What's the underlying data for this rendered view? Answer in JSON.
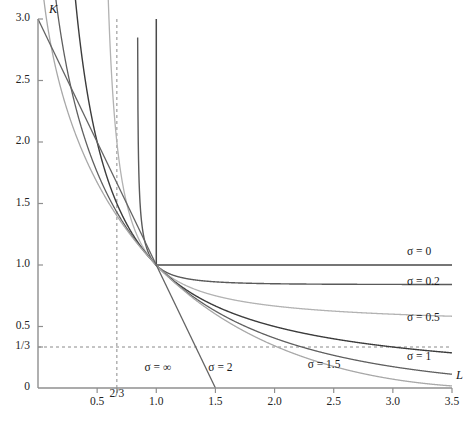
{
  "chart_data": {
    "type": "line",
    "title": "",
    "subtitle": "",
    "xlabel": "L",
    "ylabel": "K",
    "xlim": [
      0,
      3.5
    ],
    "ylim": [
      0,
      3.0
    ],
    "grid": false,
    "legend_position": "inline-annotations",
    "xticks": [
      {
        "value": 0.5,
        "label": "0.5"
      },
      {
        "value": 0.6667,
        "label": "2/3"
      },
      {
        "value": 1.0,
        "label": "1.0"
      },
      {
        "value": 1.5,
        "label": "1.5"
      },
      {
        "value": 2.0,
        "label": "2.0"
      },
      {
        "value": 2.5,
        "label": "2.5"
      },
      {
        "value": 3.0,
        "label": "3.0"
      },
      {
        "value": 3.5,
        "label": "3.5"
      }
    ],
    "yticks": [
      {
        "value": 0.0,
        "label": "0"
      },
      {
        "value": 0.3333,
        "label": "1/3"
      },
      {
        "value": 0.5,
        "label": "0.5"
      },
      {
        "value": 1.0,
        "label": "1.0"
      },
      {
        "value": 1.5,
        "label": "1.5"
      },
      {
        "value": 2.0,
        "label": "2.0"
      },
      {
        "value": 2.5,
        "label": "2.5"
      },
      {
        "value": 3.0,
        "label": "3.0"
      }
    ],
    "reference_lines": [
      {
        "name": "vertical-two-thirds",
        "orientation": "vertical",
        "value": 0.6667,
        "style": "dashed",
        "color": "#8a8a8a"
      },
      {
        "name": "horizontal-one-third",
        "orientation": "horizontal",
        "value": 0.3333,
        "style": "dashed",
        "color": "#8a8a8a"
      }
    ],
    "series": [
      {
        "name": "sigma-0",
        "label": "σ = 0",
        "sigma": 0,
        "color": "#4a4a4a",
        "width": 1.5,
        "kink": [
          1.0,
          1.0
        ],
        "label_at": [
          3.12,
          1.1
        ]
      },
      {
        "name": "sigma-0p2",
        "label": "σ = 0.2",
        "sigma": 0.2,
        "color": "#5a5a5a",
        "width": 1.4,
        "label_at": [
          3.12,
          0.855
        ]
      },
      {
        "name": "sigma-0p5",
        "label": "σ = 0.5",
        "sigma": 0.5,
        "color": "#b2b2b2",
        "width": 1.3,
        "label_at": [
          3.12,
          0.565
        ]
      },
      {
        "name": "sigma-1",
        "label": "σ = 1",
        "sigma": 1,
        "color": "#3c3c3c",
        "width": 1.4,
        "label_at": [
          3.12,
          0.245
        ]
      },
      {
        "name": "sigma-1p5",
        "label": "σ = 1.5",
        "sigma": 1.5,
        "color": "#5f5f5f",
        "width": 1.3,
        "label_at": [
          2.28,
          0.175
        ]
      },
      {
        "name": "sigma-2",
        "label": "σ = 2",
        "sigma": 2,
        "color": "#a8a8a8",
        "width": 1.3,
        "label_at": [
          1.44,
          0.155
        ]
      },
      {
        "name": "sigma-inf",
        "label": "σ = ∞",
        "sigma": "inf",
        "color": "#636363",
        "width": 1.3,
        "intercepts": {
          "K": 3.0,
          "L": 1.5
        },
        "label_at": [
          0.9,
          0.155
        ]
      }
    ],
    "axis_color": "#8f8f8f"
  },
  "axes": {
    "x_name": "L",
    "y_name": "K"
  }
}
